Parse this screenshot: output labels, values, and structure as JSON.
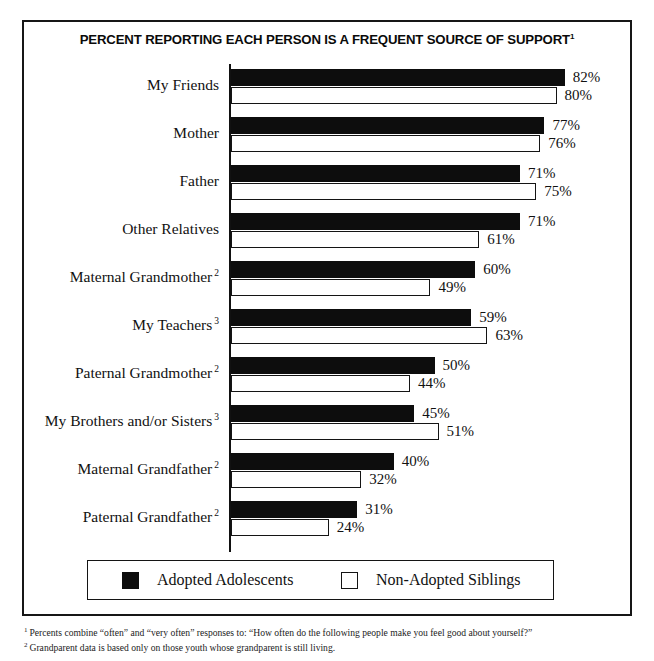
{
  "chart_data": {
    "type": "bar",
    "orientation": "horizontal",
    "title": "PERCENT REPORTING EACH PERSON IS A FREQUENT SOURCE OF SUPPORT",
    "title_superscript": "1",
    "xlabel": "",
    "ylabel": "",
    "xlim": [
      0,
      100
    ],
    "grid": false,
    "legend_position": "bottom",
    "value_suffix": "%",
    "categories": [
      "My Friends",
      "Mother",
      "Father",
      "Other Relatives",
      "Maternal Grandmother",
      "My Teachers",
      "Paternal Grandmother",
      "My Brothers and/or Sisters",
      "Maternal Grandfather",
      "Paternal Grandfather"
    ],
    "category_superscripts": [
      "",
      "",
      "",
      "",
      "2",
      "3",
      "2",
      "3",
      "2",
      "2"
    ],
    "series": [
      {
        "name": "Adopted Adolescents",
        "color": "#0d0d0d",
        "fill": "solid",
        "values": [
          82,
          77,
          71,
          71,
          60,
          59,
          50,
          45,
          40,
          31
        ],
        "labels": [
          "82%",
          "77%",
          "71%",
          "71%",
          "60%",
          "59%",
          "50%",
          "45%",
          "40%",
          "31%"
        ]
      },
      {
        "name": "Non-Adopted Siblings",
        "color": "#ffffff",
        "fill": "hollow",
        "values": [
          80,
          76,
          75,
          61,
          49,
          63,
          44,
          51,
          32,
          24
        ],
        "labels": [
          "80%",
          "76%",
          "75%",
          "61%",
          "49%",
          "63%",
          "44%",
          "51%",
          "32%",
          "24%"
        ]
      }
    ]
  },
  "legend": {
    "entries": [
      {
        "label": "Adopted Adolescents",
        "swatch": "solid-square-icon"
      },
      {
        "label": "Non-Adopted Siblings",
        "swatch": "hollow-square-icon"
      }
    ]
  },
  "footnotes": [
    {
      "marker": "1",
      "text": "Percents combine “often” and “very often” responses to: “How often do the following people make you feel good about yourself?”"
    },
    {
      "marker": "2",
      "text": "Grandparent data is based only on those youth whose grandparent is still living."
    }
  ],
  "colors": {
    "frame": "#161616",
    "bar_solid": "#0d0d0d",
    "bar_hollow_border": "#141414",
    "text": "#111111",
    "background": "#ffffff"
  }
}
